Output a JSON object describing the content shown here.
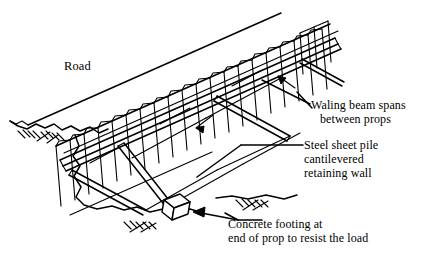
{
  "figure": {
    "background_color": "#ffffff",
    "line_color": "#000000",
    "width": 432,
    "height": 260
  },
  "labels": {
    "road": "Road",
    "waling": {
      "line1": "Waling beam spans",
      "line2": "between props"
    },
    "sheet_pile": {
      "line1": "Steel sheet pile",
      "line2": "cantilevered",
      "line3": "retaining wall"
    },
    "footing": {
      "line1": "Concrete footing at",
      "line2": "end of prop to resist the load"
    }
  },
  "components": {
    "road_surface": "road-surface",
    "ground_line": "ground-line",
    "ground_hatching": "ground-hatching-symbol",
    "sheet_pile_wall": "corrugated-sheet-pile-wall",
    "waling_beam_upper": "waling-beam-upper",
    "waling_beam_lower": "waling-beam-lower",
    "prop_left": "prop-left",
    "prop_middle": "prop-middle",
    "prop_right": "prop-right",
    "concrete_footing": "concrete-footing-block",
    "excavation_edge": "excavation-edge"
  },
  "leaders": {
    "waling_leader": "leader-line-to-waling-beam",
    "sheet_pile_leader": "leader-line-to-sheet-pile",
    "footing_leader": "leader-arrow-to-concrete-footing",
    "arrow_waling_near": "arrowhead-waling-near",
    "arrow_waling_far": "arrowhead-waling-far"
  }
}
